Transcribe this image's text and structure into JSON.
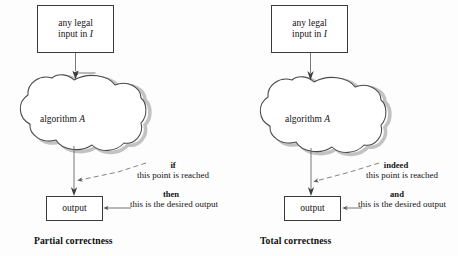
{
  "figure": {
    "width": 458,
    "height": 256,
    "background": "#fdfdfd",
    "ink": "#1a1a1a"
  },
  "panels": [
    {
      "id": "partial",
      "caption": "Partial correctness",
      "input_box": {
        "line1": "any legal",
        "line2_prefix": "input in ",
        "line2_italic": "I"
      },
      "cloud": {
        "label_prefix": "algorithm ",
        "label_italic": "A"
      },
      "output_box": {
        "label": "output"
      },
      "annotation_upper": {
        "keyword": "if",
        "text": "this point is reached"
      },
      "annotation_lower": {
        "keyword": "then",
        "text": "this is the desired output"
      }
    },
    {
      "id": "total",
      "caption": "Total correctness",
      "input_box": {
        "line1": "any legal",
        "line2_prefix": "input in ",
        "line2_italic": "I"
      },
      "cloud": {
        "label_prefix": "algorithm ",
        "label_italic": "A"
      },
      "output_box": {
        "label": "output"
      },
      "annotation_upper": {
        "keyword": "indeed",
        "text": "this point is reached"
      },
      "annotation_lower": {
        "keyword": "and",
        "text": "this is the desired output"
      }
    }
  ],
  "colors": {
    "stroke": "#3a3a3a",
    "cloud_stroke": "#4a4a4a",
    "cloud_shadow": "#b9b9b9",
    "arrow": "#5a5a5a",
    "dash": "#6e6e6e",
    "box_fill": "#ffffff"
  },
  "icons": {
    "cloud": "cloud-shape",
    "arrow_down": "arrow-down-icon",
    "dashed_pointer": "dashed-pointer-icon"
  }
}
